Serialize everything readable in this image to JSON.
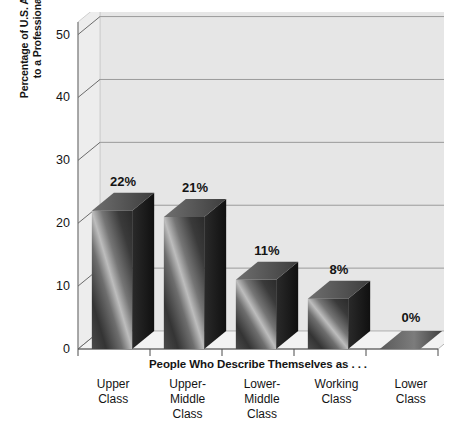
{
  "chart_data": {
    "type": "bar",
    "title": "",
    "subtitle": "",
    "xlabel": "People Who Describe Themselves as . . .",
    "ylabel_line1": "Percentage of U.S. Adults Who Belong",
    "ylabel_line2": "to a Professional Organization",
    "categories": [
      "Upper Class",
      "Upper-Middle Class",
      "Lower-Middle Class",
      "Working Class",
      "Lower Class"
    ],
    "category_lines": [
      [
        "Upper",
        "Class"
      ],
      [
        "Upper-",
        "Middle",
        "Class"
      ],
      [
        "Lower-",
        "Middle",
        "Class"
      ],
      [
        "Working",
        "Class"
      ],
      [
        "Lower",
        "Class"
      ]
    ],
    "values": [
      22,
      21,
      11,
      8,
      0
    ],
    "data_labels": [
      "22%",
      "21%",
      "11%",
      "8%",
      "0%"
    ],
    "ylim": [
      0,
      52
    ],
    "yticks": [
      0,
      10,
      20,
      30,
      40,
      50
    ],
    "ytick_labels": [
      "0",
      "10",
      "20",
      "30",
      "40",
      "50"
    ],
    "grid": true,
    "grid_axis": "y",
    "legend": false,
    "legend_position": "none",
    "style": "3d-bar",
    "colors": {
      "bar_dark": "#3c3c3c",
      "bar_light": "#c9c9c9",
      "bar_side": "#1e1e1e",
      "bar_top": "#8f8f8f",
      "wall": "#e6e6e6",
      "floor": "#f2f2f2",
      "gridline": "#9a9a9a",
      "axis": "#6b6b6b",
      "text": "#141414"
    }
  }
}
